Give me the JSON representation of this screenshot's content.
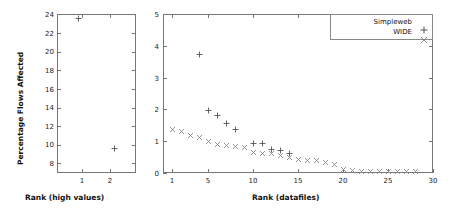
{
  "chart_data": [
    {
      "type": "scatter",
      "panel": "left",
      "title": "",
      "xlabel": "Rank (high values)",
      "ylabel": "Percentage Flows Affected",
      "xlim": [
        0.4,
        2.6
      ],
      "ylim": [
        7.2,
        24.3
      ],
      "xticks": [
        1,
        2
      ],
      "xtick_labels": [
        "1",
        "2"
      ],
      "yticks": [
        8,
        10,
        12,
        14,
        16,
        18,
        20,
        22,
        24
      ],
      "ytick_labels": [
        "8",
        "10",
        "12",
        "14",
        "16",
        "18",
        "20",
        "22",
        "24"
      ],
      "grid": false,
      "legend": "none",
      "series": [
        {
          "name": "Simpleweb",
          "marker": "plus",
          "color": "#555555",
          "x": [
            1,
            2
          ],
          "y": [
            23.8,
            9.8
          ]
        }
      ]
    },
    {
      "type": "scatter",
      "panel": "right",
      "title": "",
      "xlabel": "Rank (datafiles)",
      "ylabel": "",
      "xlim": [
        0,
        30
      ],
      "ylim": [
        0,
        5
      ],
      "xticks": [
        1,
        5,
        10,
        15,
        20,
        25,
        30
      ],
      "xtick_labels": [
        "1",
        "5",
        "10",
        "15",
        "20",
        "25",
        "30"
      ],
      "yticks": [
        0,
        1,
        2,
        3,
        4,
        5
      ],
      "ytick_labels": [
        "0",
        "1",
        "2",
        "3",
        "4",
        "5"
      ],
      "grid": false,
      "legend": "top-right",
      "series": [
        {
          "name": "Simpleweb",
          "marker": "plus",
          "color": "#555555",
          "x": [
            4,
            5,
            6,
            7,
            8,
            10,
            11,
            12,
            13,
            14
          ],
          "y": [
            3.72,
            1.95,
            1.82,
            1.56,
            1.38,
            0.92,
            0.94,
            0.74,
            0.7,
            0.6
          ]
        },
        {
          "name": "WIDE",
          "marker": "cross",
          "color": "#888888",
          "x": [
            1,
            2,
            3,
            4,
            5,
            6,
            7,
            8,
            9,
            10,
            11,
            12,
            13,
            14,
            15,
            16,
            17,
            18,
            19,
            20,
            21,
            22,
            23,
            24,
            25,
            26,
            27,
            28
          ],
          "y": [
            1.36,
            1.3,
            1.18,
            1.12,
            0.98,
            0.9,
            0.86,
            0.84,
            0.8,
            0.66,
            0.62,
            0.6,
            0.56,
            0.48,
            0.42,
            0.4,
            0.38,
            0.32,
            0.26,
            0.1,
            0.07,
            0.06,
            0.06,
            0.05,
            0.05,
            0.05,
            0.04,
            0.04
          ]
        }
      ]
    }
  ],
  "left_panel": {
    "ylabel": "Percentage Flows Affected",
    "xlabel": "Rank (high values)",
    "ytick_labels": [
      "24",
      "22",
      "20",
      "18",
      "16",
      "14",
      "12",
      "10",
      "8"
    ],
    "xtick_labels": [
      "1",
      "2"
    ]
  },
  "right_panel": {
    "xlabel": "Rank (datafiles)",
    "ytick_labels": [
      "5",
      "4",
      "3",
      "2",
      "1",
      "0"
    ],
    "xtick_labels": [
      "1",
      "5",
      "10",
      "15",
      "20",
      "25",
      "30"
    ],
    "legend": {
      "entries": [
        {
          "label": "Simpleweb",
          "marker": "plus"
        },
        {
          "label": "WIDE",
          "marker": "cross"
        }
      ]
    }
  }
}
